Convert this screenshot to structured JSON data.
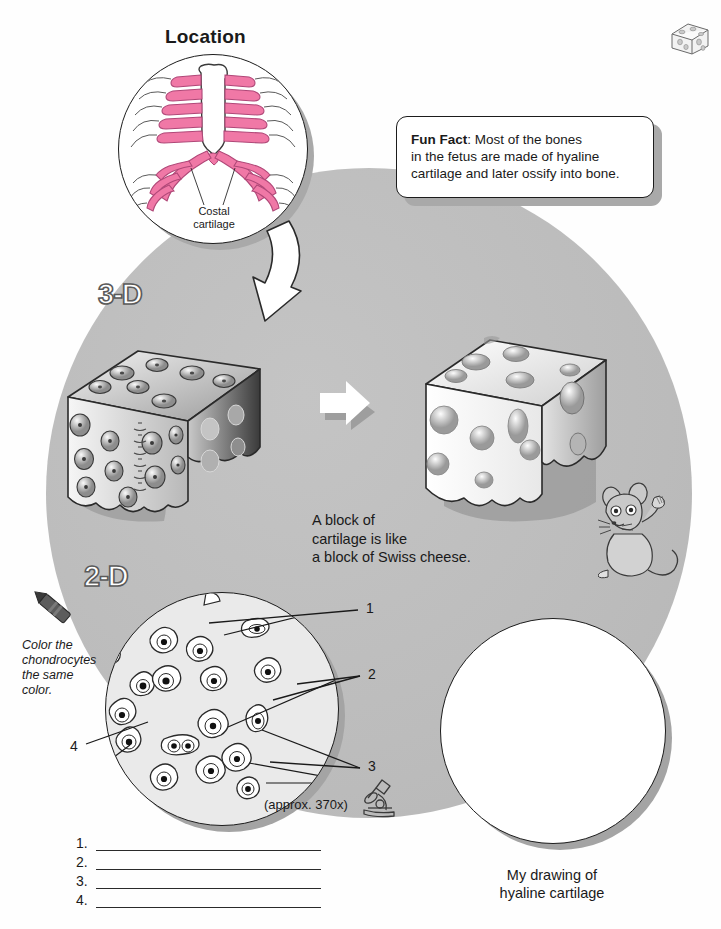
{
  "page": {
    "width": 721,
    "height": 929,
    "background": "#fefefe",
    "backdrop_color": "#c0c0c0",
    "shadow_color": "#a9a9a9",
    "cartilage_pink": "#f078a6",
    "ink": "#1c1c1c"
  },
  "location": {
    "title": "Location",
    "inset_caption_line1": "Costal",
    "inset_caption_line2": "cartilage",
    "illustration": "ribcage-costal-cartilage"
  },
  "fun_fact": {
    "label": "Fun Fact",
    "separator": ":",
    "text": "Most of the bones in the fetus are made of hyaline cartilage and later ossify into bone.",
    "line1_bold": "Fun Fact",
    "line1_rest": ":  Most of the bones",
    "line2": "in the fetus are made of hyaline",
    "line3": "cartilage and later ossify into bone."
  },
  "three_d": {
    "label": "3-D",
    "left_figure": "cartilage-block-with-chondrocytes",
    "right_figure": "swiss-cheese-block",
    "companion_figure": "mouse",
    "arrow": "right-arrow",
    "caption_line1": "A block of",
    "caption_line2": "cartilage is like",
    "caption_line3": "a block of Swiss cheese."
  },
  "two_d": {
    "label": "2-D",
    "crayon_icon": "crayon-icon",
    "color_note_line1": "Color the",
    "color_note_line2": "chondrocytes",
    "color_note_line3": "the same",
    "color_note_line4": "color.",
    "magnification": "(approx. 370x)",
    "microscope_icon": "microscope-icon",
    "leaders": [
      {
        "number": "1",
        "x": 366,
        "y": 606
      },
      {
        "number": "2",
        "x": 368,
        "y": 670
      },
      {
        "number": "3",
        "x": 368,
        "y": 763
      },
      {
        "number": "4",
        "x": 72,
        "y": 742
      }
    ]
  },
  "answer_lines": [
    {
      "number": "1."
    },
    {
      "number": "2."
    },
    {
      "number": "3."
    },
    {
      "number": "4."
    }
  ],
  "my_drawing": {
    "caption_line1": "My drawing of",
    "caption_line2": "hyaline cartilage"
  },
  "corner_thumbnail": {
    "icon": "swiss-cheese-block-thumbnail"
  }
}
